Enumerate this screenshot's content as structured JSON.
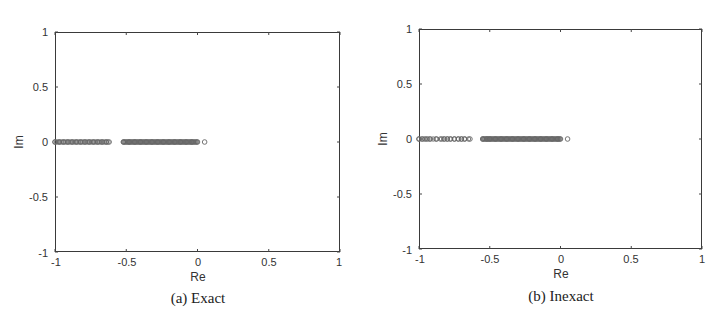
{
  "figures": [
    {
      "id": "a",
      "caption": "(a) Exact",
      "xlabel": "Re",
      "ylabel": "Im",
      "xticks": [
        "-1",
        "-0.5",
        "0",
        "0.5",
        "1"
      ],
      "yticks": [
        "1",
        "0.5",
        "0",
        "-0.5",
        "-1"
      ]
    },
    {
      "id": "b",
      "caption": "(b) Inexact",
      "xlabel": "Re",
      "ylabel": "Im",
      "xticks": [
        "-1",
        "-0.5",
        "0",
        "0.5",
        "1"
      ],
      "yticks": [
        "1",
        "0.5",
        "0",
        "-0.5",
        "-1"
      ]
    }
  ],
  "chart_data": [
    {
      "type": "scatter",
      "title": "(a) Exact",
      "xlabel": "Re",
      "ylabel": "Im",
      "xlim": [
        -1,
        1
      ],
      "ylim": [
        -1,
        1
      ],
      "grid": false,
      "marker": "open-circle",
      "series": [
        {
          "name": "eigenvalues",
          "clusters": [
            {
              "re_range": [
                -1.0,
                -0.62
              ],
              "im": 0,
              "density": "dense"
            },
            {
              "re_range": [
                -0.52,
                0.0
              ],
              "im": 0,
              "density": "very dense"
            }
          ],
          "points": [
            {
              "re": -1.0,
              "im": 0
            },
            {
              "re": -0.97,
              "im": 0
            },
            {
              "re": -0.94,
              "im": 0
            },
            {
              "re": -0.91,
              "im": 0
            },
            {
              "re": -0.88,
              "im": 0
            },
            {
              "re": -0.85,
              "im": 0
            },
            {
              "re": -0.82,
              "im": 0
            },
            {
              "re": -0.79,
              "im": 0
            },
            {
              "re": -0.76,
              "im": 0
            },
            {
              "re": -0.73,
              "im": 0
            },
            {
              "re": -0.7,
              "im": 0
            },
            {
              "re": -0.67,
              "im": 0
            },
            {
              "re": -0.64,
              "im": 0
            },
            {
              "re": -0.62,
              "im": 0
            },
            {
              "re": -0.52,
              "im": 0
            },
            {
              "re": -0.48,
              "im": 0
            },
            {
              "re": -0.44,
              "im": 0
            },
            {
              "re": -0.4,
              "im": 0
            },
            {
              "re": -0.36,
              "im": 0
            },
            {
              "re": -0.32,
              "im": 0
            },
            {
              "re": -0.28,
              "im": 0
            },
            {
              "re": -0.24,
              "im": 0
            },
            {
              "re": -0.2,
              "im": 0
            },
            {
              "re": -0.16,
              "im": 0
            },
            {
              "re": -0.12,
              "im": 0
            },
            {
              "re": -0.08,
              "im": 0
            },
            {
              "re": -0.04,
              "im": 0
            },
            {
              "re": 0.0,
              "im": 0
            },
            {
              "re": 0.05,
              "im": 0
            }
          ]
        }
      ]
    },
    {
      "type": "scatter",
      "title": "(b) Inexact",
      "xlabel": "Re",
      "ylabel": "Im",
      "xlim": [
        -1,
        1
      ],
      "ylim": [
        -1,
        1
      ],
      "grid": false,
      "marker": "open-circle",
      "series": [
        {
          "name": "eigenvalues",
          "clusters": [
            {
              "re_range": [
                -1.0,
                -0.63
              ],
              "im": 0,
              "density": "sparse-to-medium"
            },
            {
              "re_range": [
                -0.55,
                0.0
              ],
              "im": 0,
              "density": "very dense"
            }
          ],
          "points": [
            {
              "re": -1.0,
              "im": 0
            },
            {
              "re": -0.98,
              "im": 0
            },
            {
              "re": -0.96,
              "im": 0
            },
            {
              "re": -0.94,
              "im": 0
            },
            {
              "re": -0.92,
              "im": 0
            },
            {
              "re": -0.88,
              "im": 0
            },
            {
              "re": -0.84,
              "im": 0
            },
            {
              "re": -0.82,
              "im": 0
            },
            {
              "re": -0.8,
              "im": 0
            },
            {
              "re": -0.78,
              "im": 0
            },
            {
              "re": -0.75,
              "im": 0
            },
            {
              "re": -0.72,
              "im": 0
            },
            {
              "re": -0.7,
              "im": 0
            },
            {
              "re": -0.68,
              "im": 0
            },
            {
              "re": -0.64,
              "im": 0
            },
            {
              "re": -0.55,
              "im": 0
            },
            {
              "re": -0.52,
              "im": 0
            },
            {
              "re": -0.5,
              "im": 0
            },
            {
              "re": -0.46,
              "im": 0
            },
            {
              "re": -0.42,
              "im": 0
            },
            {
              "re": -0.38,
              "im": 0
            },
            {
              "re": -0.34,
              "im": 0
            },
            {
              "re": -0.3,
              "im": 0
            },
            {
              "re": -0.26,
              "im": 0
            },
            {
              "re": -0.22,
              "im": 0
            },
            {
              "re": -0.18,
              "im": 0
            },
            {
              "re": -0.14,
              "im": 0
            },
            {
              "re": -0.1,
              "im": 0
            },
            {
              "re": -0.06,
              "im": 0
            },
            {
              "re": -0.02,
              "im": 0
            },
            {
              "re": 0.0,
              "im": 0
            },
            {
              "re": 0.05,
              "im": 0
            }
          ]
        }
      ]
    }
  ]
}
